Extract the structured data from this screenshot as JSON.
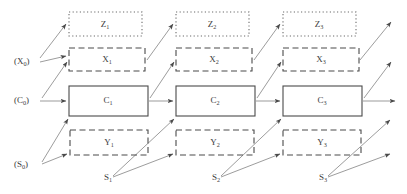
{
  "diagram": {
    "type": "temporal-graphical-model",
    "title": "",
    "background_color": "#ffffff",
    "stroke_color": "#4a4a4a",
    "edge_color": "#8a8a8a",
    "columns": [
      {
        "index": 1,
        "z": {
          "label": "Z",
          "subscript": "1",
          "style": "dotted",
          "x": 69,
          "y": 12,
          "w": 73,
          "h": 24
        },
        "x": {
          "label": "X",
          "subscript": "1",
          "style": "dashed",
          "x": 69,
          "y": 48,
          "w": 76,
          "h": 23
        },
        "c": {
          "label": "C",
          "subscript": "1",
          "style": "solid",
          "x": 69,
          "y": 86,
          "w": 79,
          "h": 30
        },
        "y": {
          "label": "Y",
          "subscript": "1",
          "style": "dashed",
          "x": 70,
          "y": 130,
          "w": 78,
          "h": 25
        },
        "s": {
          "label": "S",
          "subscript": "1",
          "x": 104,
          "y": 178
        }
      },
      {
        "index": 2,
        "z": {
          "label": "Z",
          "subscript": "2",
          "style": "dotted",
          "x": 176,
          "y": 12,
          "w": 73,
          "h": 24
        },
        "x": {
          "label": "X",
          "subscript": "2",
          "style": "dashed",
          "x": 176,
          "y": 48,
          "w": 76,
          "h": 23
        },
        "c": {
          "label": "C",
          "subscript": "2",
          "style": "solid",
          "x": 176,
          "y": 86,
          "w": 79,
          "h": 30
        },
        "y": {
          "label": "Y",
          "subscript": "2",
          "style": "dashed",
          "x": 176,
          "y": 130,
          "w": 78,
          "h": 25
        },
        "s": {
          "label": "S",
          "subscript": "2",
          "x": 212,
          "y": 178
        }
      },
      {
        "index": 3,
        "z": {
          "label": "Z",
          "subscript": "3",
          "style": "dotted",
          "x": 283,
          "y": 12,
          "w": 73,
          "h": 24
        },
        "x": {
          "label": "X",
          "subscript": "3",
          "style": "dashed",
          "x": 283,
          "y": 48,
          "w": 76,
          "h": 23
        },
        "c": {
          "label": "C",
          "subscript": "3",
          "style": "solid",
          "x": 283,
          "y": 86,
          "w": 79,
          "h": 30
        },
        "y": {
          "label": "Y",
          "subscript": "3",
          "style": "dashed",
          "x": 283,
          "y": 130,
          "w": 78,
          "h": 25
        },
        "s": {
          "label": "S",
          "subscript": "3",
          "x": 319,
          "y": 178
        }
      }
    ],
    "initial_labels": [
      {
        "name": "x0",
        "text": "(X",
        "subscript": "0",
        "close": ")",
        "x": 14,
        "y": 62
      },
      {
        "name": "c0",
        "text": "(C",
        "subscript": "0",
        "close": ")",
        "x": 14,
        "y": 101
      },
      {
        "name": "s0",
        "text": "(S",
        "subscript": "0",
        "close": ")",
        "x": 14,
        "y": 165
      }
    ],
    "node_labels": [
      "Z1",
      "Z2",
      "Z3",
      "X1",
      "X2",
      "X3",
      "C1",
      "C2",
      "C3",
      "Y1",
      "Y2",
      "Y3",
      "S1",
      "S2",
      "S3",
      "(X0)",
      "(C0)",
      "(S0)"
    ]
  }
}
